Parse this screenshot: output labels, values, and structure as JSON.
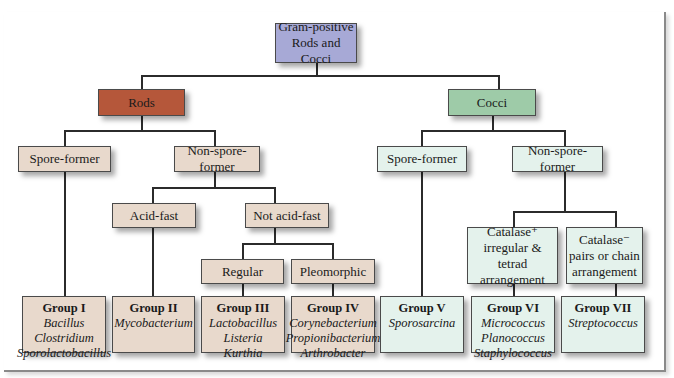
{
  "root": {
    "line1": "Gram-positive",
    "line2": "Rods and Cocci"
  },
  "rods": {
    "label": "Rods",
    "spore_former": "Spore-former",
    "non_spore_former": "Non-spore-former",
    "acid_fast": "Acid-fast",
    "not_acid_fast": "Not acid-fast",
    "regular": "Regular",
    "pleomorphic": "Pleomorphic"
  },
  "cocci": {
    "label": "Cocci",
    "spore_former": "Spore-former",
    "non_spore_former": "Non-spore-former",
    "catalase_pos": {
      "line1": "Catalase⁺",
      "line2": "irregular & tetrad",
      "line3": "arrangement"
    },
    "catalase_neg": {
      "line1": "Catalase⁻",
      "line2": "pairs or chain",
      "line3": "arrangement"
    }
  },
  "groups": [
    {
      "title": "Group I",
      "genera": [
        "Bacillus",
        "Clostridium",
        "Sporolactobacillus"
      ]
    },
    {
      "title": "Group II",
      "genera": [
        "Mycobacterium"
      ]
    },
    {
      "title": "Group III",
      "genera": [
        "Lactobacillus",
        "Listeria",
        "Kurthia"
      ]
    },
    {
      "title": "Group IV",
      "genera": [
        "Corynebacterium",
        "Propionibacterium",
        "Arthrobacter"
      ]
    },
    {
      "title": "Group V",
      "genera": [
        "Sporosarcina"
      ]
    },
    {
      "title": "Group VI",
      "genera": [
        "Micrococcus",
        "Planococcus",
        "Staphylococcus"
      ]
    },
    {
      "title": "Group VII",
      "genera": [
        "Streptococcus"
      ]
    }
  ],
  "colors": {
    "root": "#a7a9d6",
    "rods": "#b5573a",
    "cocci": "#9ecba8",
    "rods_branch": "#e8d9cc",
    "cocci_branch": "#e4f2ec"
  }
}
